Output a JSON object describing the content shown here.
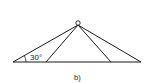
{
  "diagram": {
    "angle_label": "30°",
    "caption": "b)",
    "colors": {
      "line": "#1a1a1a",
      "background": "#ffffff"
    },
    "apex": {
      "x": 78,
      "y": 24
    },
    "baseline": {
      "y": 62,
      "x_start": 13,
      "x_end": 141
    },
    "feet": [
      13,
      46,
      111,
      141
    ]
  }
}
